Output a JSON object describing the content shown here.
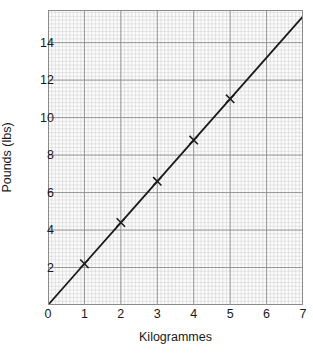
{
  "chart_data": {
    "type": "line",
    "title": "",
    "subtitle": "",
    "xlabel": "Kilogrammes",
    "ylabel": "Pounds (lbs)",
    "xlim": [
      0,
      7
    ],
    "ylim": [
      0,
      15.74
    ],
    "xticks": [
      0,
      1,
      2,
      3,
      4,
      5,
      6,
      7
    ],
    "xtick_labels": [
      "0",
      "1",
      "2",
      "3",
      "4",
      "5",
      "6",
      "7"
    ],
    "yticks": [
      2,
      4,
      6,
      8,
      10,
      12,
      14
    ],
    "ytick_labels": [
      "2",
      "4",
      "6",
      "8",
      "10",
      "12",
      "14"
    ],
    "grid": true,
    "minor_grid": true,
    "major_grid_step_x": 1,
    "major_grid_step_y": 2,
    "minor_grid_divisions_x": 10,
    "minor_grid_divisions_y": 10,
    "legend": null,
    "legend_position": "none",
    "annotations": [],
    "series": [
      {
        "name": "Conversion line",
        "marker": "x",
        "line_style": "solid",
        "x": [
          0,
          1,
          2,
          3,
          4,
          5,
          7
        ],
        "y": [
          0,
          2.2,
          4.4,
          6.6,
          8.8,
          11.0,
          15.4
        ],
        "marked_points": [
          {
            "x": 1,
            "y": 2.2
          },
          {
            "x": 2,
            "y": 4.4
          },
          {
            "x": 3,
            "y": 6.6
          },
          {
            "x": 4,
            "y": 8.8
          },
          {
            "x": 5,
            "y": 11.0
          }
        ],
        "slope": 2.2,
        "intercept": 0
      }
    ]
  },
  "colors": {
    "background": "#ffffff",
    "plot_background": "#fbfbfb",
    "minor_grid": "#cfcfcf",
    "major_grid": "#8f8f8f",
    "border": "#8a8a8a",
    "line": "#1a1a1a",
    "marker": "#1a1a1a",
    "text": "#1a1a1a"
  }
}
